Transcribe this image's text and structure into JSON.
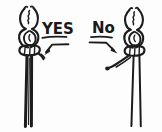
{
  "figure": {
    "type": "hand-drawn-instructional-sketch",
    "background_color": "#fdfdfd",
    "ink_color": "#1c1c1c",
    "width_px": 162,
    "height_px": 132
  },
  "left": {
    "name": "correct-knot",
    "label": "YES",
    "label_underlined": true,
    "verdict": "correct",
    "description": "knot with long tail continuing straight down",
    "annotation": {
      "arrow_direction": "down-left",
      "points_to": "knot body"
    }
  },
  "right": {
    "name": "incorrect-knot",
    "label": "No",
    "label_underlined": true,
    "verdict": "incorrect",
    "description": "knot with short curled tail stub",
    "annotation": {
      "arrow_direction": "down-right",
      "points_to": "short tail"
    }
  }
}
